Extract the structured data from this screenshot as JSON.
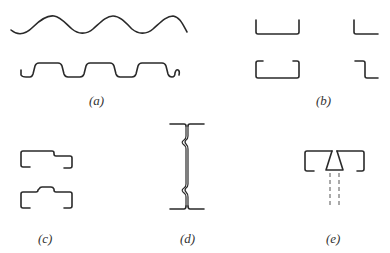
{
  "figure": {
    "panels": [
      {
        "id": "a",
        "label": "(a)",
        "shapes": [
          "sinusoidal-corrugated-sheet",
          "trapezoidal-deck-profile"
        ]
      },
      {
        "id": "b",
        "label": "(b)",
        "shapes": [
          "plain-channel",
          "plain-angle",
          "lipped-channel",
          "z-section"
        ]
      },
      {
        "id": "c",
        "label": "(c)",
        "shapes": [
          "stepped-lipped-section",
          "hat-lipped-section"
        ]
      },
      {
        "id": "d",
        "label": "(d)",
        "shapes": [
          "interlocking-back-to-back-section"
        ]
      },
      {
        "id": "e",
        "label": "(e)",
        "shapes": [
          "twin-lipped-channels-with-tapered-joint"
        ]
      }
    ]
  },
  "colors": {
    "stroke": "#2a2a2a",
    "background": "#ffffff",
    "label": "#333333"
  }
}
